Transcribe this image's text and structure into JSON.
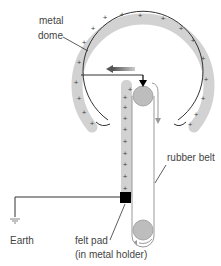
{
  "labels": {
    "dome_line1": "metal",
    "dome_line2": "dome",
    "belt": "rubber belt",
    "earth": "Earth",
    "pad_line1": "felt pad",
    "pad_line2": "(in metal holder)"
  },
  "charge_symbol": "+",
  "colors": {
    "charge_band": "#cfcfcf",
    "roller": "#bdbdbd",
    "line": "#333333",
    "belt_outline": "#999999",
    "pad": "#000000",
    "text": "#444444"
  }
}
